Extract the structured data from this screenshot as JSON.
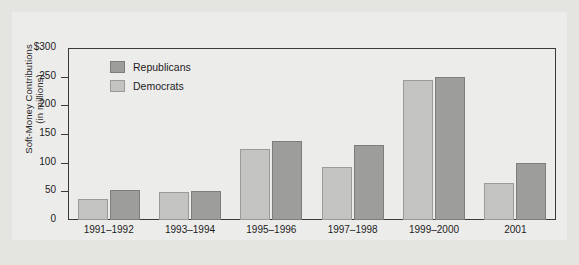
{
  "chart_data": {
    "type": "bar",
    "title": "",
    "xlabel": "",
    "ylabel": "Soft-Money Contributions\n(in millions)",
    "ylim": [
      0,
      300
    ],
    "ytick_labels": [
      "$300",
      "250",
      "200",
      "150",
      "100",
      "50",
      "0"
    ],
    "ytick_values": [
      300,
      250,
      200,
      150,
      100,
      50,
      0
    ],
    "grid": false,
    "legend_position": "inside-top-left",
    "categories": [
      "1991–1992",
      "1993–1994",
      "1995–1996",
      "1997–1998",
      "1999–2000",
      "2001"
    ],
    "series": [
      {
        "name": "Democrats",
        "color": "#c3c3c1",
        "values": [
          36,
          48,
          123,
          93,
          244,
          64
        ]
      },
      {
        "name": "Republicans",
        "color": "#9d9d9b",
        "values": [
          52,
          51,
          138,
          131,
          250,
          100
        ]
      }
    ],
    "legend": [
      {
        "label": "Republicans",
        "color": "#9d9d9b",
        "swatch": "rep"
      },
      {
        "label": "Democrats",
        "color": "#c3c3c1",
        "swatch": "dem"
      }
    ]
  },
  "colors": {
    "page_background": "#e4e4e1",
    "panel_background": "#ececeb",
    "frame_border": "#3a3a3a",
    "republicans": "#9d9d9b",
    "democrats": "#c3c3c1",
    "text": "#1c1c1c"
  }
}
